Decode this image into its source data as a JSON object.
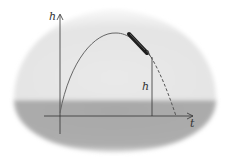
{
  "diagram": {
    "title": "",
    "axes": {
      "y_label": "h",
      "x_label": "t"
    },
    "height_marker_label": "h",
    "colors": {
      "sky": "#e6e6e6",
      "ground": "#a9a9a9",
      "curve": "#555555",
      "axis": "#333333",
      "pen": "#222222"
    },
    "elements": [
      "parabolic trajectory (solid to pen, dashed after)",
      "pen drawing curve",
      "vertical height segment",
      "dome-shaped background with ground band"
    ]
  }
}
